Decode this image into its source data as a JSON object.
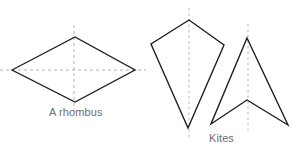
{
  "figure": {
    "width": 296,
    "height": 150,
    "background_color": "#ffffff",
    "stroke_color": "#231f20",
    "axis_color": "#b3b3b3",
    "caption_color": "#6e6e6e"
  },
  "captions": {
    "rhombus": "A rhombus",
    "kites": "Kites"
  },
  "shapes": {
    "rhombus": {
      "label": "A rhombus",
      "points": "12,70 75,37 135,70 75,102",
      "symmetry_axes": [
        {
          "name": "horizontal",
          "x1": 0,
          "y1": 70,
          "x2": 146,
          "y2": 70
        },
        {
          "name": "vertical",
          "x1": 74,
          "y1": 25,
          "x2": 74,
          "y2": 112
        }
      ]
    },
    "kite_convex": {
      "label": "Kite",
      "points": "189,20 224,45 188,128 151,44",
      "symmetry_axes": [
        {
          "name": "vertical",
          "x1": 189,
          "y1": 8,
          "x2": 189,
          "y2": 139
        }
      ]
    },
    "kite_dart": {
      "label": "Dart kite",
      "points": "247,38 288,125 247,100 211,124",
      "symmetry_axes": [
        {
          "name": "vertical",
          "x1": 248,
          "y1": 24,
          "x2": 248,
          "y2": 133
        }
      ]
    }
  }
}
